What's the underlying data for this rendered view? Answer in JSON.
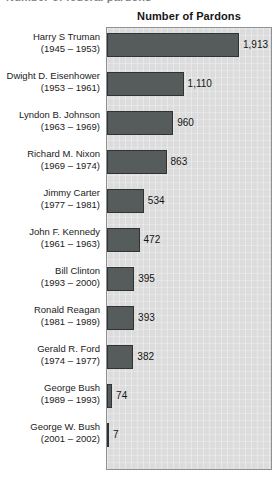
{
  "page": {
    "cropped_header_text": "Number of federal pardons"
  },
  "chart_data": {
    "type": "bar",
    "orientation": "horizontal",
    "title": "Number of Pardons",
    "xlabel": "",
    "ylabel": "",
    "xlim": [
      0,
      2400
    ],
    "grid": false,
    "legend": "none",
    "categories": [
      "Harry S Truman",
      "Dwight D. Eisenhower",
      "Lyndon B. Johnson",
      "Richard M. Nixon",
      "Jimmy Carter",
      "John F. Kennedy",
      "Bill Clinton",
      "Ronald Reagan",
      "Gerald R. Ford",
      "George Bush",
      "George W. Bush"
    ],
    "category_sublabels": [
      "(1945 – 1953)",
      "(1953 – 1961)",
      "(1963 – 1969)",
      "(1969 – 1974)",
      "(1977 – 1981)",
      "(1961 – 1963)",
      "(1993 – 2000)",
      "(1981 – 1989)",
      "(1974 – 1977)",
      "(1989 – 1993)",
      "(2001 – 2002)"
    ],
    "values": [
      1913,
      1110,
      960,
      863,
      534,
      472,
      395,
      393,
      382,
      74,
      7
    ],
    "value_labels": [
      "1,913",
      "1,110",
      "960",
      "863",
      "534",
      "472",
      "395",
      "393",
      "382",
      "74",
      "7"
    ],
    "colors": {
      "bar_fill": "#565b5b",
      "bar_stroke": "#2f3333",
      "plot_background": "#dcdcdc",
      "plot_border": "#8e9194",
      "text": "#1b1b1b"
    }
  }
}
